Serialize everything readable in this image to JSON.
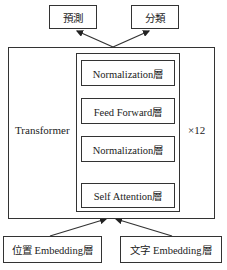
{
  "outputs": [
    {
      "label": "預測"
    },
    {
      "label": "分類"
    }
  ],
  "transformer": {
    "label": "Transformer",
    "repeat": "×12",
    "layers": [
      {
        "label": "Normalization層"
      },
      {
        "label": "Feed Forward層"
      },
      {
        "label": "Normalization層"
      },
      {
        "label": "Self Attention層"
      }
    ]
  },
  "inputs": [
    {
      "label": "位置 Embedding層"
    },
    {
      "label": "文字 Embedding層"
    }
  ]
}
